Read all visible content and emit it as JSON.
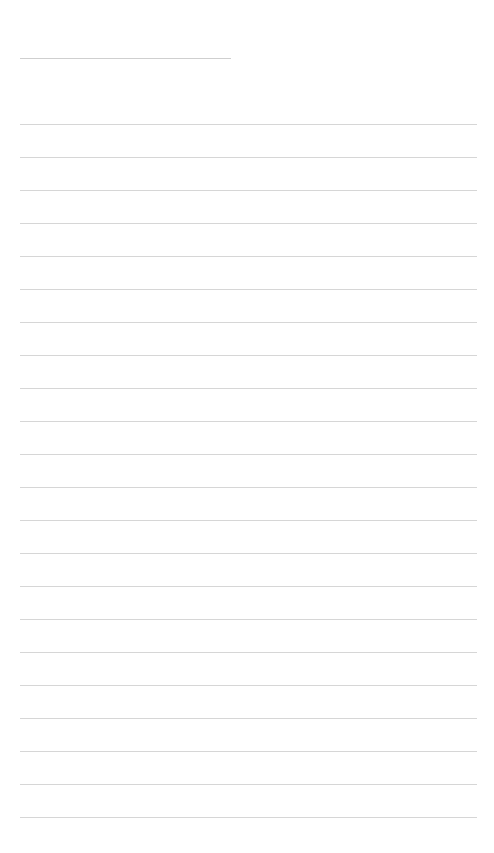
{
  "page": {
    "background": "#ffffff",
    "rule_color": "#d6d6d6",
    "title_line": {
      "text": "",
      "x": 20,
      "y": 58,
      "width": 211
    },
    "ruled_lines": {
      "x": 20,
      "width": 457,
      "first_y": 124,
      "spacing": 33,
      "count": 22,
      "texts": [
        "",
        "",
        "",
        "",
        "",
        "",
        "",
        "",
        "",
        "",
        "",
        "",
        "",
        "",
        "",
        "",
        "",
        "",
        "",
        "",
        "",
        ""
      ]
    }
  }
}
